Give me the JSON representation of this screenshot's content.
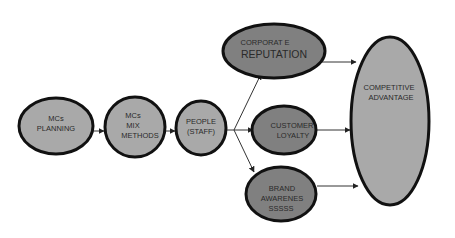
{
  "diagram": {
    "colors": {
      "light_fill": "#a9a9a9",
      "dark_fill": "#808080",
      "stroke": "#111111",
      "arrow": "#333333",
      "text": "#2a2a2a"
    },
    "nodes": [
      {
        "id": "mcs-planning",
        "lines": [
          "MCs",
          "PLANNING"
        ],
        "shade": "light"
      },
      {
        "id": "mcs-mix-methods",
        "lines": [
          "MCs",
          "MIX",
          "METHODS"
        ],
        "shade": "light"
      },
      {
        "id": "people-staff",
        "lines": [
          "PEOPLE",
          "(STAFF)"
        ],
        "shade": "light"
      },
      {
        "id": "corporate-reputation",
        "lines": [
          "CORPORAT E",
          "REPUTATION"
        ],
        "shade": "dark"
      },
      {
        "id": "customer-loyalty",
        "lines": [
          "CUSTOMER",
          "LOYALTY"
        ],
        "shade": "dark"
      },
      {
        "id": "brand-awareness",
        "lines": [
          "BRAND",
          "AWARENES",
          "SSSSS"
        ],
        "shade": "dark"
      },
      {
        "id": "competitive-advantage",
        "lines": [
          "COMPETITIVE",
          "ADVANTAGE"
        ],
        "shade": "light"
      }
    ],
    "edges": [
      {
        "from": "mcs-planning",
        "to": "mcs-mix-methods"
      },
      {
        "from": "mcs-mix-methods",
        "to": "people-staff"
      },
      {
        "from": "people-staff",
        "to": "corporate-reputation"
      },
      {
        "from": "people-staff",
        "to": "customer-loyalty"
      },
      {
        "from": "people-staff",
        "to": "brand-awareness"
      },
      {
        "from": "corporate-reputation",
        "to": "competitive-advantage"
      },
      {
        "from": "customer-loyalty",
        "to": "competitive-advantage"
      },
      {
        "from": "brand-awareness",
        "to": "competitive-advantage"
      }
    ]
  }
}
